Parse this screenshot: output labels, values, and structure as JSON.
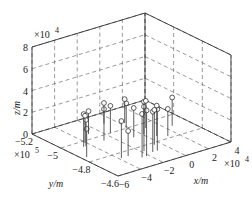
{
  "chart_data": {
    "type": "scatter3d-stem",
    "title": "",
    "xlabel": "x/m",
    "ylabel": "y/m",
    "zlabel": "z/m",
    "x_multiplier": "×10^4",
    "y_multiplier": "×10^5",
    "z_multiplier": "×10^4",
    "xlim": [
      -6,
      4
    ],
    "ylim": [
      -5.2,
      -4.6
    ],
    "zlim": [
      0,
      8
    ],
    "x_ticks": [
      -6,
      -4,
      -2,
      0,
      2,
      4
    ],
    "y_ticks": [
      -4.6,
      -4.8,
      -5,
      -5.2
    ],
    "z_ticks": [
      0,
      2,
      4,
      6,
      8
    ],
    "grid": true,
    "grid_style": "dashed",
    "marker": "open-circle",
    "points": [
      {
        "x": -5.6,
        "y": -4.85,
        "z": 2.6
      },
      {
        "x": -4.6,
        "y": -4.95,
        "z": 3.0
      },
      {
        "x": -4.4,
        "y": -4.95,
        "z": 2.4
      },
      {
        "x": -4.1,
        "y": -4.98,
        "z": 2.5
      },
      {
        "x": -3.8,
        "y": -4.75,
        "z": 3.4
      },
      {
        "x": -3.2,
        "y": -4.75,
        "z": 2.3
      },
      {
        "x": -2.9,
        "y": -5.05,
        "z": 2.1
      },
      {
        "x": -2.6,
        "y": -4.7,
        "z": 4.0
      },
      {
        "x": -2.2,
        "y": -4.7,
        "z": 4.2
      },
      {
        "x": -1.8,
        "y": -4.75,
        "z": 4.1
      },
      {
        "x": -1.6,
        "y": -5.0,
        "z": 2.5
      },
      {
        "x": -1.4,
        "y": -4.72,
        "z": 3.7
      },
      {
        "x": -1.0,
        "y": -4.72,
        "z": 3.8
      },
      {
        "x": -0.8,
        "y": -4.9,
        "z": 2.7
      },
      {
        "x": -0.5,
        "y": -4.78,
        "z": 3.2
      },
      {
        "x": -0.2,
        "y": -5.0,
        "z": 2.3
      },
      {
        "x": 0.1,
        "y": -4.9,
        "z": 3.0
      },
      {
        "x": 0.3,
        "y": -5.05,
        "z": 2.2
      },
      {
        "x": 0.6,
        "y": -4.85,
        "z": 2.8
      },
      {
        "x": 0.9,
        "y": -4.95,
        "z": 2.5
      },
      {
        "x": 1.2,
        "y": -4.82,
        "z": 2.5
      },
      {
        "x": 2.6,
        "y": -4.9,
        "z": 2.6
      },
      {
        "x": -2.8,
        "y": -4.95,
        "z": 2.9
      },
      {
        "x": -0.9,
        "y": -5.1,
        "z": 1.9
      }
    ]
  },
  "labels": {
    "x_axis": "x/m",
    "y_axis": "y/m",
    "z_axis": "z/m",
    "x_mult_base": "×10",
    "x_mult_exp": "4",
    "y_mult_base": "×10",
    "y_mult_exp": "5",
    "z_mult_base": "×10",
    "z_mult_exp": "4",
    "x_ticks": [
      "-6",
      "-4",
      "-2",
      "0",
      "2",
      "4"
    ],
    "y_ticks": [
      "-4.6",
      "-4.8",
      "-5",
      "-5.2"
    ],
    "z_ticks": [
      "0",
      "2",
      "4",
      "6",
      "8"
    ]
  }
}
